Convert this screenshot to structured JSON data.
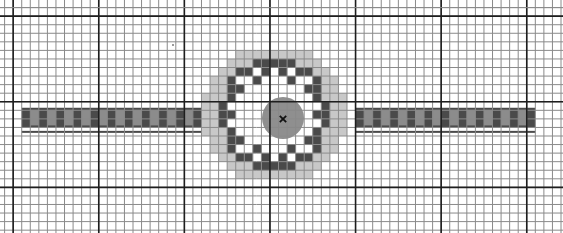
{
  "canvas": {
    "width": 563,
    "height": 233,
    "background": "#ffffff"
  },
  "grid": {
    "origin_x": 4.6,
    "origin_y": 7.6,
    "cell": 8.56,
    "cols": 65,
    "rows": 27,
    "major_every": 10,
    "major_offset_x": 1,
    "major_offset_y": 1,
    "minor_color": "#8a8a8a",
    "major_color": "#1e1e1e"
  },
  "colors": {
    "halo": "#c8c8c8",
    "dark": "#4a4a4a",
    "bar_light": "#8c8c8c",
    "center": "#8f8f8f",
    "marker": "#111111",
    "stray_dot": "#9a9a9a"
  },
  "left_bar": {
    "col_start": 2,
    "col_end": 23,
    "row_start": 11.7,
    "row_end": 14,
    "rail_row": 14.4
  },
  "right_bar": {
    "col_start": 41,
    "col_end": 62,
    "row_start": 11.7,
    "row_end": 14,
    "rail_row": 14.4
  },
  "ring": {
    "halo_cells": [
      [
        27,
        5
      ],
      [
        28,
        5
      ],
      [
        29,
        5
      ],
      [
        30,
        5
      ],
      [
        31,
        5
      ],
      [
        32,
        5
      ],
      [
        33,
        5
      ],
      [
        34,
        5
      ],
      [
        35,
        5
      ],
      [
        26,
        6
      ],
      [
        27,
        6
      ],
      [
        28,
        6
      ],
      [
        34,
        6
      ],
      [
        35,
        6
      ],
      [
        36,
        6
      ],
      [
        25,
        7
      ],
      [
        26,
        7
      ],
      [
        36,
        7
      ],
      [
        37,
        7
      ],
      [
        24,
        8
      ],
      [
        25,
        8
      ],
      [
        37,
        8
      ],
      [
        38,
        8
      ],
      [
        24,
        9
      ],
      [
        25,
        9
      ],
      [
        37,
        9
      ],
      [
        38,
        9
      ],
      [
        23,
        10
      ],
      [
        24,
        10
      ],
      [
        25,
        10
      ],
      [
        37,
        10
      ],
      [
        38,
        10
      ],
      [
        39,
        10
      ],
      [
        23,
        11
      ],
      [
        24,
        11
      ],
      [
        38,
        11
      ],
      [
        39,
        11
      ],
      [
        23,
        12
      ],
      [
        24,
        12
      ],
      [
        38,
        12
      ],
      [
        39,
        12
      ],
      [
        23,
        13
      ],
      [
        24,
        13
      ],
      [
        38,
        13
      ],
      [
        39,
        13
      ],
      [
        23,
        14
      ],
      [
        24,
        14
      ],
      [
        25,
        14
      ],
      [
        37,
        14
      ],
      [
        38,
        14
      ],
      [
        39,
        14
      ],
      [
        24,
        15
      ],
      [
        25,
        15
      ],
      [
        37,
        15
      ],
      [
        38,
        15
      ],
      [
        24,
        16
      ],
      [
        25,
        16
      ],
      [
        37,
        16
      ],
      [
        38,
        16
      ],
      [
        25,
        17
      ],
      [
        26,
        17
      ],
      [
        36,
        17
      ],
      [
        37,
        17
      ],
      [
        26,
        18
      ],
      [
        27,
        18
      ],
      [
        28,
        18
      ],
      [
        34,
        18
      ],
      [
        35,
        18
      ],
      [
        36,
        18
      ],
      [
        27,
        19
      ],
      [
        28,
        19
      ],
      [
        29,
        19
      ],
      [
        30,
        19
      ],
      [
        31,
        19
      ],
      [
        32,
        19
      ],
      [
        33,
        19
      ],
      [
        34,
        19
      ],
      [
        35,
        19
      ]
    ],
    "dark_cells": [
      [
        29,
        6
      ],
      [
        30,
        6
      ],
      [
        31,
        6
      ],
      [
        32,
        6
      ],
      [
        33,
        6
      ],
      [
        27,
        7
      ],
      [
        28,
        7
      ],
      [
        30,
        7
      ],
      [
        32,
        7
      ],
      [
        34,
        7
      ],
      [
        35,
        7
      ],
      [
        26,
        8
      ],
      [
        29,
        8
      ],
      [
        33,
        8
      ],
      [
        36,
        8
      ],
      [
        26,
        9
      ],
      [
        27,
        9
      ],
      [
        35,
        9
      ],
      [
        36,
        9
      ],
      [
        26,
        10
      ],
      [
        36,
        10
      ],
      [
        25,
        11
      ],
      [
        37,
        11
      ],
      [
        25,
        12
      ],
      [
        26,
        12
      ],
      [
        36,
        12
      ],
      [
        37,
        12
      ],
      [
        25,
        13
      ],
      [
        37,
        13
      ],
      [
        26,
        14
      ],
      [
        36,
        14
      ],
      [
        26,
        15
      ],
      [
        27,
        15
      ],
      [
        35,
        15
      ],
      [
        36,
        15
      ],
      [
        26,
        16
      ],
      [
        29,
        16
      ],
      [
        33,
        16
      ],
      [
        36,
        16
      ],
      [
        27,
        17
      ],
      [
        28,
        17
      ],
      [
        30,
        17
      ],
      [
        32,
        17
      ],
      [
        34,
        17
      ],
      [
        35,
        17
      ],
      [
        29,
        18
      ],
      [
        30,
        18
      ],
      [
        31,
        18
      ],
      [
        32,
        18
      ],
      [
        33,
        18
      ]
    ],
    "center": {
      "cx": 283,
      "cy": 118,
      "r": 21
    },
    "marker": {
      "x": 283,
      "y": 119,
      "size": 3.2
    }
  },
  "stray_dot": {
    "x": 173,
    "y": 45
  }
}
